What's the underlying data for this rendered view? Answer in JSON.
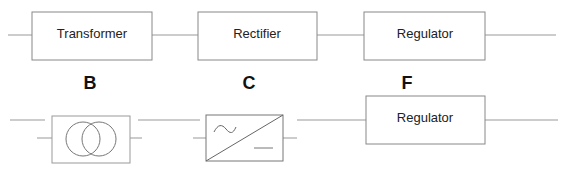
{
  "diagram": {
    "top_row": {
      "blocks": [
        {
          "label": "Transformer"
        },
        {
          "label": "Rectifier"
        },
        {
          "label": "Regulator"
        }
      ]
    },
    "section_letters": [
      "B",
      "C",
      "F"
    ],
    "bottom_row": {
      "symbols": [
        {
          "name": "transformer-symbol",
          "description": "two overlapping circles"
        },
        {
          "name": "rectifier-symbol",
          "description": "AC to DC converter box with sine wave and DC line"
        }
      ],
      "blocks": [
        {
          "label": "Regulator"
        }
      ]
    },
    "colors": {
      "stroke": "#888888",
      "text": "#222222",
      "background": "#ffffff"
    }
  }
}
